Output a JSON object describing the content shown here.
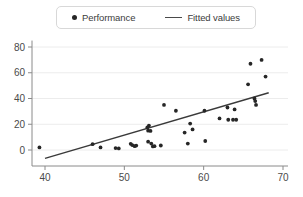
{
  "legend": {
    "position": "top-center",
    "entries": [
      {
        "label": "Performance",
        "marker": "dot-marker-icon",
        "color": "#262626"
      },
      {
        "label": "Fitted values",
        "marker": "line-marker-icon",
        "color": "#4a4a4a"
      }
    ]
  },
  "chart_data": {
    "type": "scatter",
    "title": "",
    "xlabel": "",
    "ylabel": "",
    "xlim": [
      40,
      70
    ],
    "ylim": [
      -10,
      85
    ],
    "xticks": [
      40,
      50,
      60,
      70
    ],
    "yticks": [
      0,
      20,
      40,
      60,
      80
    ],
    "grid": "horizontal",
    "legend_position": "top-center",
    "series": [
      {
        "name": "Performance",
        "type": "scatter",
        "marker": "filled-circle",
        "color": "#262626",
        "points": [
          [
            39.3,
            2.0
          ],
          [
            46.0,
            4.5
          ],
          [
            47.0,
            2.0
          ],
          [
            48.9,
            1.5
          ],
          [
            49.3,
            1.2
          ],
          [
            50.8,
            4.8
          ],
          [
            51.0,
            3.8
          ],
          [
            51.3,
            3.0
          ],
          [
            51.5,
            3.4
          ],
          [
            52.9,
            17.5
          ],
          [
            53.0,
            15.0
          ],
          [
            53.1,
            19.0
          ],
          [
            53.3,
            14.8
          ],
          [
            53.0,
            6.5
          ],
          [
            53.4,
            5.0
          ],
          [
            53.6,
            2.8
          ],
          [
            53.8,
            3.0
          ],
          [
            54.6,
            3.5
          ],
          [
            55.0,
            35.0
          ],
          [
            56.5,
            30.5
          ],
          [
            57.6,
            13.5
          ],
          [
            58.0,
            5.0
          ],
          [
            58.3,
            20.5
          ],
          [
            58.6,
            16.0
          ],
          [
            60.1,
            30.5
          ],
          [
            60.2,
            7.0
          ],
          [
            62.0,
            24.5
          ],
          [
            63.0,
            33.0
          ],
          [
            63.1,
            23.5
          ],
          [
            63.7,
            23.5
          ],
          [
            63.9,
            31.5
          ],
          [
            64.1,
            23.5
          ],
          [
            65.6,
            51.0
          ],
          [
            65.9,
            67.0
          ],
          [
            66.4,
            40.0
          ],
          [
            66.5,
            38.0
          ],
          [
            66.6,
            35.0
          ],
          [
            67.3,
            70.0
          ],
          [
            67.8,
            57.0
          ]
        ]
      },
      {
        "name": "Fitted values",
        "type": "line",
        "color": "#3a3a3a",
        "endpoints": [
          [
            40.0,
            -6.5
          ],
          [
            68.2,
            44.5
          ]
        ]
      }
    ]
  }
}
